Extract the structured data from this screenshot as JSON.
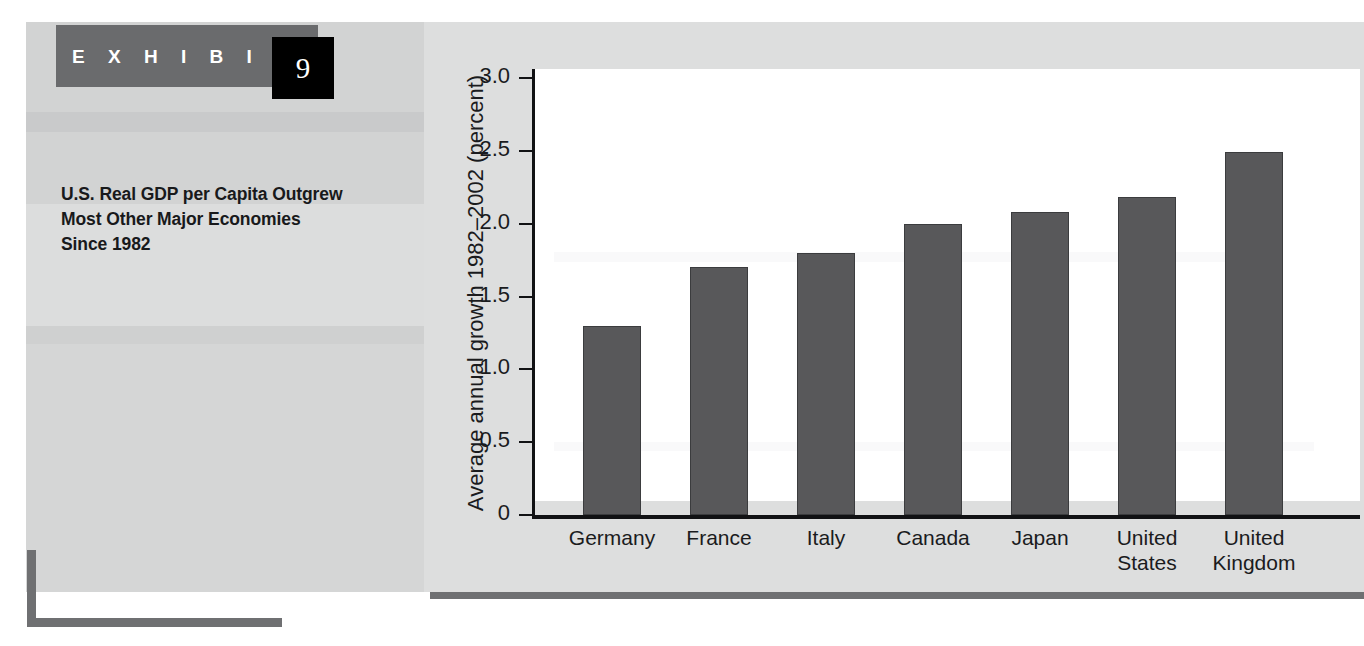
{
  "exhibit": {
    "label": "E X H I B I T",
    "number": "9",
    "title": "U.S. Real GDP per Capita Outgrew Most Other Major Economies Since 1982"
  },
  "colors": {
    "bar_fill": "#58585a",
    "bar_stroke": "#3b3c3e",
    "panel_background": "#dddede",
    "sidebar_background": "#d2d3d3",
    "rule": "#6f7072",
    "axis": "#111214",
    "exhibit_band": "#6a6b6d",
    "exhibit_box": "#000000"
  },
  "chart_data": {
    "type": "bar",
    "title": "U.S. Real GDP per Capita Outgrew Most Other Major Economies Since 1982",
    "xlabel": "",
    "ylabel": "Average annual growth 1982–2002 (percent)",
    "categories": [
      "Germany",
      "France",
      "Italy",
      "Canada",
      "Japan",
      "United States",
      "United Kingdom"
    ],
    "category_lines": [
      [
        "Germany"
      ],
      [
        "France"
      ],
      [
        "Italy"
      ],
      [
        "Canada"
      ],
      [
        "Japan"
      ],
      [
        "United",
        "States"
      ],
      [
        "United",
        "Kingdom"
      ]
    ],
    "values": [
      1.3,
      1.7,
      1.8,
      2.0,
      2.08,
      2.18,
      2.49
    ],
    "ylim": [
      0,
      3.0
    ],
    "yticks": [
      0,
      0.5,
      1.0,
      1.5,
      2.0,
      2.5,
      3.0
    ],
    "ytick_labels": [
      "0",
      "0.5",
      "1.0",
      "1.5",
      "2.0",
      "2.5",
      "3.0"
    ],
    "grid": false,
    "legend": null
  }
}
